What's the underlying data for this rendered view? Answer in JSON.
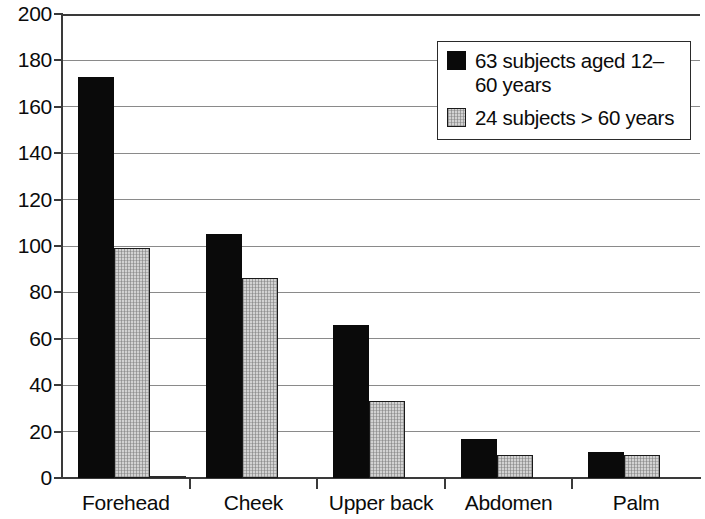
{
  "chart_data": {
    "type": "bar",
    "title": "",
    "subtitle": "",
    "xlabel": "",
    "ylabel": "",
    "categories": [
      "Forehead",
      "Cheek",
      "Upper back",
      "Abdomen",
      "Palm"
    ],
    "series": [
      {
        "name": "63 subjects aged 12–60 years",
        "color": "#0a0a0a",
        "style": "solid-black",
        "values": [
          173,
          105,
          66,
          17,
          11
        ]
      },
      {
        "name": "24 subjects > 60 years",
        "color": "#d2d2d2",
        "style": "gray-hatched",
        "values": [
          99,
          86,
          33,
          10,
          10
        ]
      },
      {
        "name": "",
        "color": "#fdfdfd",
        "style": "white-outline",
        "values": [
          1,
          0,
          0,
          0,
          0
        ]
      }
    ],
    "ylim": [
      0,
      200
    ],
    "ytick_step": 20,
    "yticks": [
      0,
      20,
      40,
      60,
      80,
      100,
      120,
      140,
      160,
      180,
      200
    ],
    "ytick_labels": [
      "0",
      "20",
      "40",
      "60",
      "80",
      "100",
      "120",
      "140",
      "160",
      "180",
      "200"
    ],
    "grid": true,
    "grid_axis": "y",
    "legend_position": "top-right",
    "legend": [
      {
        "label": "63 subjects aged 12–60 years",
        "swatch": "solid-black"
      },
      {
        "label": "24 subjects > 60 years",
        "swatch": "gray-hatched"
      }
    ]
  },
  "axis": {
    "y_labels": [
      "200",
      "180",
      "160",
      "140",
      "120",
      "100",
      "80",
      "60",
      "40",
      "20",
      "0"
    ],
    "x_labels": [
      "Forehead",
      "Cheek",
      "Upper back",
      "Abdomen",
      "Palm"
    ]
  },
  "legend": {
    "entry_1": "63 subjects aged 12–60 years",
    "entry_2": "24 subjects > 60 years"
  }
}
